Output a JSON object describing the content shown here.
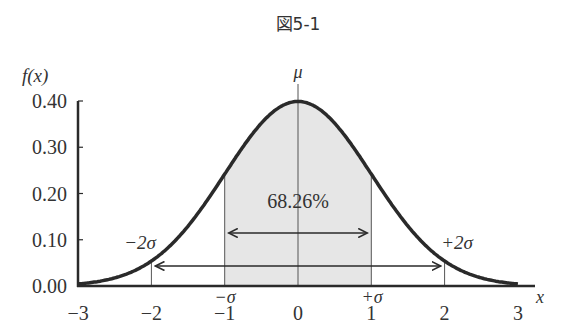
{
  "figure": {
    "title": "図5-1",
    "y_axis_label": "f(x)",
    "x_axis_label": "x",
    "mu_label": "μ",
    "center_label": "68.26%",
    "minus_sigma_label": "−σ",
    "plus_sigma_label": "+σ",
    "minus_2sigma_label": "−2σ",
    "plus_2sigma_label": "+2σ",
    "y_ticks": [
      "0.40",
      "0.30",
      "0.20",
      "0.10",
      "0.00"
    ],
    "x_ticks": [
      "−3",
      "−2",
      "−1",
      "0",
      "1",
      "2",
      "3"
    ],
    "colors": {
      "curve": "#2a2a2a",
      "shade": "#e6e6e6",
      "axis": "#2a2a2a",
      "text": "#333333"
    }
  },
  "chart_data": {
    "type": "line",
    "title": "図5-1",
    "xlabel": "x",
    "ylabel": "f(x)",
    "xlim": [
      -3,
      3
    ],
    "ylim": [
      0,
      0.4
    ],
    "x_ticks": [
      -3,
      -2,
      -1,
      0,
      1,
      2,
      3
    ],
    "y_ticks": [
      0.0,
      0.1,
      0.2,
      0.3,
      0.4
    ],
    "series": [
      {
        "name": "standard normal density f(x)",
        "x": [
          -3,
          -2.5,
          -2,
          -1.5,
          -1,
          -0.5,
          0,
          0.5,
          1,
          1.5,
          2,
          2.5,
          3
        ],
        "y": [
          0.004,
          0.018,
          0.054,
          0.13,
          0.242,
          0.352,
          0.399,
          0.352,
          0.242,
          0.13,
          0.054,
          0.018,
          0.004
        ]
      }
    ],
    "annotations": [
      {
        "text": "μ",
        "x": 0,
        "note": "mean line"
      },
      {
        "text": "68.26%",
        "shaded_region": [
          -1,
          1
        ],
        "note": "area within ±1σ"
      },
      {
        "text": "−σ",
        "x": -1
      },
      {
        "text": "+σ",
        "x": 1
      },
      {
        "text": "−2σ",
        "x": -2
      },
      {
        "text": "+2σ",
        "x": 2
      },
      {
        "arrow": "double",
        "from": -1,
        "to": 1
      },
      {
        "arrow": "double",
        "from": -2,
        "to": 2
      }
    ],
    "grid": false,
    "legend": "none"
  }
}
